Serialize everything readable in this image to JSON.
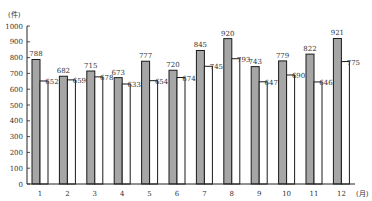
{
  "chart_data": {
    "type": "bar",
    "title": "",
    "ylabel": "(件)",
    "xlabel": "(月)",
    "ylim": [
      0,
      1000
    ],
    "yticks": [
      0,
      100,
      200,
      300,
      400,
      500,
      600,
      700,
      800,
      900,
      1000
    ],
    "grid": false,
    "legend": null,
    "categories": [
      "1",
      "2",
      "3",
      "4",
      "5",
      "6",
      "7",
      "8",
      "9",
      "10",
      "11",
      "12"
    ],
    "series": [
      {
        "name": "series-gray",
        "color": "#a6a6a6",
        "values": [
          788,
          682,
          715,
          673,
          777,
          720,
          845,
          920,
          743,
          779,
          822,
          921
        ]
      },
      {
        "name": "series-white",
        "color": "#ffffff",
        "values": [
          652,
          659,
          678,
          633,
          654,
          674,
          745,
          793,
          647,
          690,
          646,
          775
        ]
      }
    ]
  },
  "colors": {
    "axis": "#222222",
    "bar_outline": "#1a1a1a",
    "gray_fill": "#a6a6a6",
    "white_fill": "#ffffff"
  }
}
